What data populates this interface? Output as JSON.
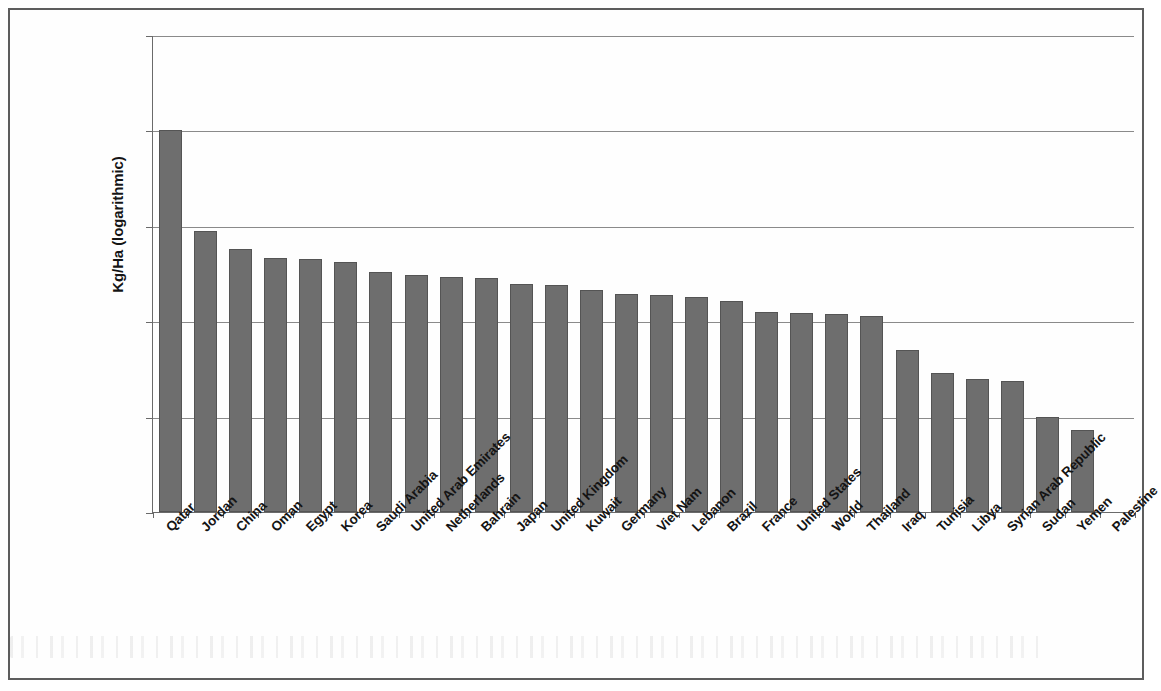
{
  "chart_data": {
    "type": "bar",
    "title": "",
    "subtitle": "",
    "xlabel": "",
    "ylabel": "Kg/Ha (logarithmic)",
    "scale": "log",
    "ylim": [
      1.0,
      100000.0
    ],
    "ytick_labels": [
      "100000.0",
      "10000.0",
      "1000.0",
      "100.0",
      "10.0",
      "1.0"
    ],
    "ytick_values": [
      100000.0,
      10000.0,
      1000.0,
      100.0,
      10.0,
      1.0
    ],
    "grid": true,
    "legend": false,
    "legend_position": "none",
    "bar_color": "#6e6e6e",
    "bar_edge_color": "#545454",
    "categories": [
      "Qatar",
      "Jordan",
      "China",
      "Oman",
      "Egypt",
      "Korea",
      "Saudi Arabia",
      "United Arab Emirates",
      "Netherlands",
      "Bahrain",
      "Japan",
      "United Kingdom",
      "Kuwait",
      "Germany",
      "Viet Nam",
      "Lebanon",
      "Brazil",
      "France",
      "United States",
      "World",
      "Thailand",
      "Iraq",
      "Tunisia",
      "Libya",
      "Syrian Arab Republic",
      "Sudan",
      "Yemen",
      "Palestine"
    ],
    "values": [
      10000,
      880,
      565,
      455,
      445,
      415,
      330,
      305,
      292,
      283,
      245,
      238,
      210,
      195,
      188,
      178,
      162,
      124,
      122,
      120,
      113,
      50,
      29,
      24.5,
      23.5,
      9.8,
      7.2,
      0
    ]
  }
}
